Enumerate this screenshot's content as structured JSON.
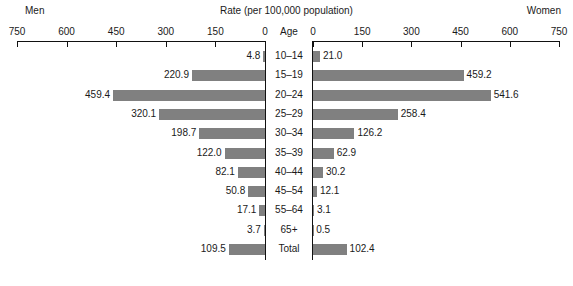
{
  "header": {
    "title": "Rate (per 100,000 population)",
    "left_label": "Men",
    "right_label": "Women",
    "age_header": "Age"
  },
  "axis": {
    "left_ticks": [
      "750",
      "600",
      "450",
      "300",
      "150",
      "0"
    ],
    "right_ticks": [
      "0",
      "150",
      "300",
      "450",
      "600",
      "750"
    ]
  },
  "chart_data": {
    "type": "bar",
    "orientation": "horizontal",
    "subtype": "population-pyramid",
    "title": "Rate (per 100,000 population)",
    "xlabel": "Rate (per 100,000 population)",
    "ylabel": "Age",
    "xlim": [
      0,
      750
    ],
    "xticks": [
      0,
      150,
      300,
      450,
      600,
      750
    ],
    "grid": false,
    "legend": "none",
    "categories": [
      "10–14",
      "15–19",
      "20–24",
      "25–29",
      "30–34",
      "35–39",
      "40–44",
      "45–54",
      "55–64",
      "65+",
      "Total"
    ],
    "series": [
      {
        "name": "Men",
        "side": "left",
        "values": [
          4.8,
          220.9,
          459.4,
          320.1,
          198.7,
          122.0,
          82.1,
          50.8,
          17.1,
          3.7,
          109.5
        ],
        "labels": [
          "4.8",
          "220.9",
          "459.4",
          "320.1",
          "198.7",
          "122.0",
          "82.1",
          "50.8",
          "17.1",
          "3.7",
          "109.5"
        ]
      },
      {
        "name": "Women",
        "side": "right",
        "values": [
          21.0,
          459.2,
          541.6,
          258.4,
          126.2,
          62.9,
          30.2,
          12.1,
          3.1,
          0.5,
          102.4
        ],
        "labels": [
          "21.0",
          "459.2",
          "541.6",
          "258.4",
          "126.2",
          "62.9",
          "30.2",
          "12.1",
          "3.1",
          "0.5",
          "102.4"
        ]
      }
    ],
    "bar_color": "#808080",
    "axis_color": "#111111"
  }
}
